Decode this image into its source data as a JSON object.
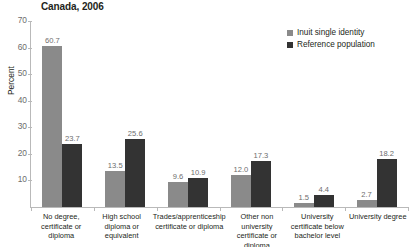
{
  "chart_data": {
    "type": "bar",
    "title": "Canada, 2006",
    "xlabel": "",
    "ylabel": "Percent",
    "ylim": [
      0,
      70
    ],
    "yticks": [
      70,
      60,
      50,
      40,
      30,
      20,
      10
    ],
    "grid": false,
    "legend_position": "top-right",
    "categories": [
      "No degree, certificate or diploma",
      "High school diploma or equivalent",
      "Trades/apprenticeship certificate or diploma",
      "Other non university certificate or diploma",
      "University certificate below bachelor level",
      "University degree"
    ],
    "series": [
      {
        "name": "Inuit single identity",
        "color": "#8a8a8a",
        "values": [
          60.7,
          13.5,
          9.6,
          12.0,
          1.5,
          2.7
        ]
      },
      {
        "name": "Reference population",
        "color": "#333333",
        "values": [
          23.7,
          25.6,
          10.9,
          17.3,
          4.4,
          18.2
        ]
      }
    ]
  },
  "labels": {
    "value_strings": {
      "series0": [
        "60.7",
        "13.5",
        "9.6",
        "12.0",
        "1.5",
        "2.7"
      ],
      "series1": [
        "23.7",
        "25.6",
        "10.9",
        "17.3",
        "4.4",
        "18.2"
      ]
    },
    "ytick_strings": [
      "70",
      "60",
      "50",
      "40",
      "30",
      "20",
      "10"
    ]
  }
}
